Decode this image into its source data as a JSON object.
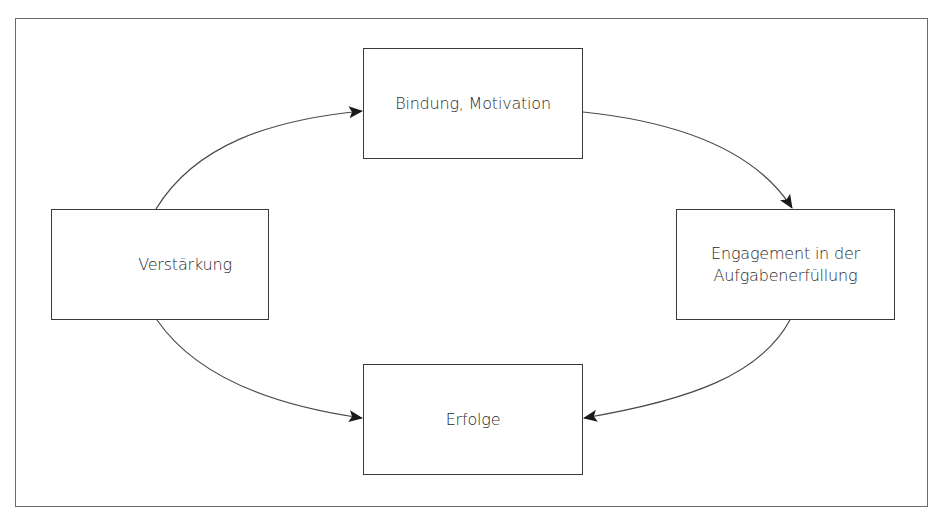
{
  "diagram": {
    "type": "cycle",
    "nodes": [
      {
        "id": "bindung",
        "label": "Bindung, Motivation"
      },
      {
        "id": "engagement",
        "label_lines": [
          "Engagement in der",
          "Aufgabenerfüllung"
        ]
      },
      {
        "id": "erfolge",
        "label": "Erfolge"
      },
      {
        "id": "verstaerkung",
        "label": "Verstärkung"
      }
    ],
    "edges": [
      {
        "from": "verstaerkung",
        "to": "bindung"
      },
      {
        "from": "bindung",
        "to": "engagement"
      },
      {
        "from": "engagement",
        "to": "erfolge"
      },
      {
        "from": "verstaerkung",
        "to": "erfolge"
      }
    ],
    "colors": {
      "stroke": "#3a3a3a",
      "frame": "#6a6a6a",
      "text": "#2a2a2a",
      "background": "#ffffff"
    }
  }
}
